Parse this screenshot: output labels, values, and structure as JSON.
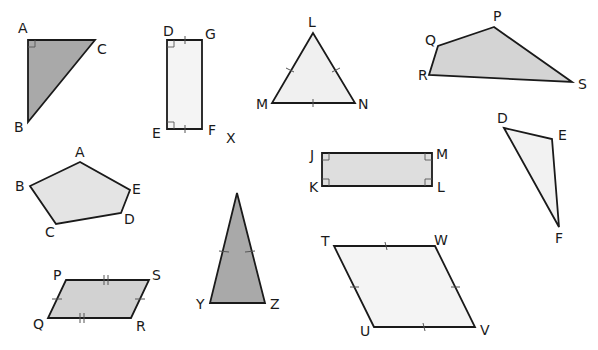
{
  "colors": {
    "stroke": "#1a1a1a",
    "dark_fill": "#a9a9a9",
    "mid_fill": "#d4d4d4",
    "light_fill": "#ececec",
    "very_light_fill": "#f4f4f4"
  },
  "shapes": [
    {
      "id": "triangle-abc",
      "type": "right triangle",
      "labels": [
        "A",
        "B",
        "C"
      ]
    },
    {
      "id": "rectangle-dgfe",
      "type": "rectangle",
      "labels": [
        "D",
        "G",
        "F",
        "E"
      ]
    },
    {
      "id": "triangle-lmn",
      "type": "equilateral triangle",
      "labels": [
        "L",
        "M",
        "N"
      ]
    },
    {
      "id": "quad-pqrs",
      "type": "quadrilateral",
      "labels": [
        "P",
        "Q",
        "R",
        "S"
      ]
    },
    {
      "id": "pentagon-abcde",
      "type": "pentagon",
      "labels": [
        "A",
        "B",
        "C",
        "D",
        "E"
      ]
    },
    {
      "id": "rectangle-jmlk",
      "type": "rectangle",
      "labels": [
        "J",
        "M",
        "L",
        "K"
      ]
    },
    {
      "id": "triangle-def",
      "type": "scalene triangle",
      "labels": [
        "D",
        "E",
        "F"
      ]
    },
    {
      "id": "parallelogram-pqrs",
      "type": "parallelogram",
      "labels": [
        "P",
        "S",
        "R",
        "Q"
      ]
    },
    {
      "id": "triangle-yz",
      "type": "isosceles triangle",
      "labels": [
        "Y",
        "Z"
      ]
    },
    {
      "id": "rhombus-twvu",
      "type": "rhombus",
      "labels": [
        "T",
        "W",
        "V",
        "U"
      ]
    }
  ],
  "stray_label": "X"
}
